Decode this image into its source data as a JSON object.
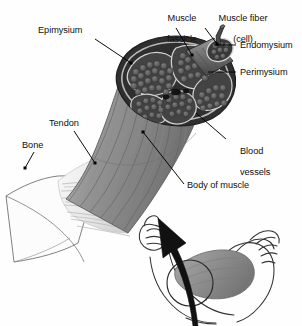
{
  "figure": {
    "palette": {
      "background": "#fefefe",
      "ink": "#111111",
      "leader_line": "#000000",
      "muscle_body_gray": "#8b8b8b",
      "muscle_body_dark": "#6e6e6e",
      "cross_section_dark": "#3a3a3a",
      "fascicle_fill": "#4a4a4a",
      "fiber_fill": "#5d5d5d",
      "tendon_light": "#e8e8e8",
      "bone_outline": "#444444",
      "arrow_black": "#111111",
      "arm_line": "#333333",
      "bicep_shade": "#8f8f8f"
    }
  },
  "labels": [
    {
      "id": "epimysium",
      "text": "Epimysium",
      "x": 38,
      "y": 30,
      "lines": [
        "Epimysium"
      ]
    },
    {
      "id": "muscle-fascicle",
      "text": "Muscle fascicle",
      "x": 148,
      "y": 4,
      "lines": [
        "Muscle",
        "fascicle"
      ]
    },
    {
      "id": "muscle-fiber",
      "text": "Muscle fiber (cell)",
      "x": 203,
      "y": 4,
      "lines": [
        "Muscle fiber",
        "(cell)"
      ]
    },
    {
      "id": "endomysium",
      "text": "Endomysium",
      "x": 238,
      "y": 41,
      "lines": [
        "Endomysium"
      ]
    },
    {
      "id": "perimysium",
      "text": "Perimysium",
      "x": 238,
      "y": 68,
      "lines": [
        "Perimysium"
      ]
    },
    {
      "id": "blood-vessels",
      "text": "Blood vessels",
      "x": 228,
      "y": 140,
      "lines": [
        "Blood",
        "vessels"
      ]
    },
    {
      "id": "tendon",
      "text": "Tendon",
      "x": 49,
      "y": 120,
      "lines": [
        "Tendon"
      ]
    },
    {
      "id": "bone",
      "text": "Bone",
      "x": 22,
      "y": 142,
      "lines": [
        "Bone"
      ]
    },
    {
      "id": "body-of-muscle",
      "text": "Body of muscle",
      "x": 186,
      "y": 182,
      "lines": [
        "Body of muscle"
      ]
    }
  ],
  "leaders": [
    {
      "id": "epimysium-leader",
      "from": [
        95,
        39
      ],
      "to": [
        131,
        63
      ],
      "dot": "end"
    },
    {
      "id": "muscle-fascicle-leader",
      "from": [
        176,
        28
      ],
      "to": [
        192,
        55
      ],
      "dot": "end"
    },
    {
      "id": "muscle-fiber-leader",
      "from": [
        205,
        28
      ],
      "to": [
        217,
        44
      ],
      "dot": "end"
    },
    {
      "id": "endomysium-leader",
      "from": [
        236,
        45
      ],
      "to": [
        214,
        45
      ],
      "dot": "end"
    },
    {
      "id": "perimysium-leader",
      "from": [
        236,
        72
      ],
      "to": [
        208,
        72
      ],
      "dot": "end"
    },
    {
      "id": "blood-vessels-leader",
      "from": [
        226,
        139
      ],
      "to": [
        196,
        113
      ],
      "dot": "end"
    },
    {
      "id": "tendon-leader",
      "from": [
        74,
        131
      ],
      "to": [
        95,
        163
      ],
      "dot": "end"
    },
    {
      "id": "bone-leader",
      "from": [
        34,
        152
      ],
      "to": [
        25,
        168
      ],
      "dot": "end"
    },
    {
      "id": "body-of-muscle-leader",
      "from": [
        184,
        184
      ],
      "to": [
        143,
        132
      ],
      "dot": "end"
    }
  ],
  "callouts": {
    "arrow": {
      "id": "magnify-arrow",
      "description": "curved arrow from arm to muscle body"
    },
    "circle": {
      "id": "bicep-highlight-circle",
      "cx": 190,
      "cy": 283,
      "r": 23
    }
  },
  "inset": {
    "id": "flexed-arm",
    "description": "line drawing of a flexed arm showing the biceps"
  }
}
